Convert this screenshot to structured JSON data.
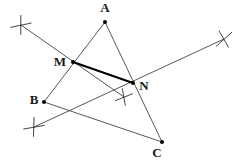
{
  "figure": {
    "width": 245,
    "height": 162,
    "background_color": "#ffffff",
    "stroke_color": "#2b2b2b",
    "highlight_color": "#000000",
    "thin_stroke_width": 0.8,
    "thick_stroke_width": 2.1,
    "dot_radius": 2.0
  },
  "labels": {
    "A": "A",
    "B": "B",
    "C": "C",
    "M": "M",
    "N": "N"
  },
  "chart_data": {
    "type": "diagram",
    "points": [
      {
        "name": "A",
        "label": "A",
        "x": 105,
        "y": 22,
        "label_x": 105,
        "label_y": 12,
        "label_anchor": "middle",
        "dot": true
      },
      {
        "name": "B",
        "label": "B",
        "x": 44,
        "y": 102,
        "label_x": 34,
        "label_y": 104,
        "label_anchor": "middle",
        "dot": true
      },
      {
        "name": "C",
        "label": "C",
        "x": 162,
        "y": 142,
        "label_x": 157,
        "label_y": 157,
        "label_anchor": "middle",
        "dot": true
      },
      {
        "name": "M",
        "label": "M",
        "x": 73,
        "y": 62,
        "label_x": 60,
        "label_y": 66,
        "label_anchor": "middle",
        "dot": true
      },
      {
        "name": "N",
        "label": "N",
        "x": 133,
        "y": 83,
        "label_x": 144,
        "label_y": 90,
        "label_anchor": "middle",
        "dot": true
      }
    ],
    "segments": [
      {
        "name": "side-AB",
        "from": "A",
        "to": "B",
        "x1": 105,
        "y1": 22,
        "x2": 44,
        "y2": 102,
        "weight": "thin"
      },
      {
        "name": "side-AC",
        "from": "A",
        "to": "C",
        "x1": 105,
        "y1": 22,
        "x2": 162,
        "y2": 142,
        "weight": "thin"
      },
      {
        "name": "side-BC",
        "from": "B",
        "to": "C",
        "x1": 44,
        "y1": 102,
        "x2": 162,
        "y2": 142,
        "weight": "thin"
      },
      {
        "name": "midsegment-MN",
        "from": "M",
        "to": "N",
        "x1": 73,
        "y1": 62,
        "x2": 133,
        "y2": 83,
        "weight": "thick"
      }
    ],
    "construction_lines": [
      {
        "name": "perpendicular-bisector-AB",
        "x1": 21,
        "y1": 25,
        "x2": 124,
        "y2": 97,
        "weight": "thin"
      },
      {
        "name": "perpendicular-bisector-AC",
        "x1": 34,
        "y1": 127,
        "x2": 224,
        "y2": 39,
        "weight": "thin"
      }
    ],
    "arc_crosses": [
      {
        "name": "arc-cross-top-left",
        "x": 21,
        "y": 25,
        "size": 9,
        "rotation": 18
      },
      {
        "name": "arc-cross-top-right",
        "x": 224,
        "y": 39,
        "size": 9,
        "rotation": -12
      },
      {
        "name": "arc-cross-bottom-left",
        "x": 34,
        "y": 127,
        "size": 9,
        "rotation": 20
      },
      {
        "name": "arc-cross-center",
        "x": 124,
        "y": 97,
        "size": 8,
        "rotation": 8
      }
    ]
  }
}
